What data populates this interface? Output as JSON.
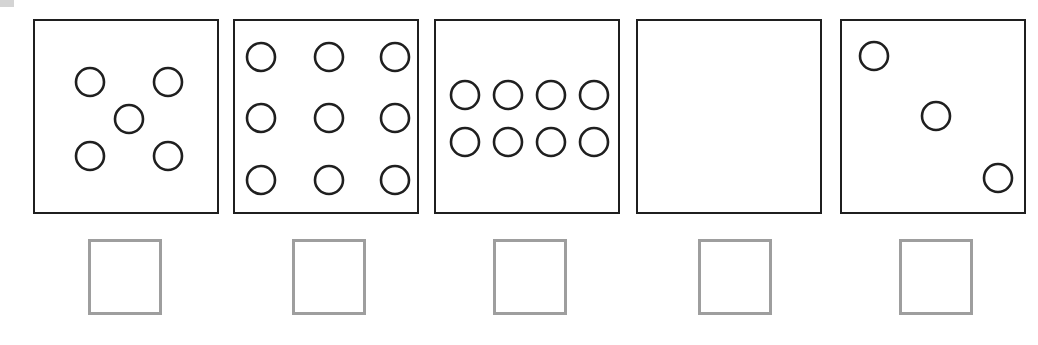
{
  "worksheet": {
    "panel_count": 5,
    "colors": {
      "panel_border": "#1f1f1f",
      "circle_stroke": "#1f1f1f",
      "answer_box_border": "#9e9e9e",
      "background": "#ffffff"
    },
    "panels": [
      {
        "index": 1,
        "circle_count": 5,
        "arrangement": "dice-five",
        "left": 33,
        "circles": [
          {
            "cx": 55,
            "cy": 61
          },
          {
            "cx": 133,
            "cy": 61
          },
          {
            "cx": 94,
            "cy": 98
          },
          {
            "cx": 55,
            "cy": 135
          },
          {
            "cx": 133,
            "cy": 135
          }
        ]
      },
      {
        "index": 2,
        "circle_count": 9,
        "arrangement": "grid-3x3",
        "left": 233,
        "circles": [
          {
            "cx": 26,
            "cy": 36
          },
          {
            "cx": 94,
            "cy": 36
          },
          {
            "cx": 160,
            "cy": 36
          },
          {
            "cx": 26,
            "cy": 97
          },
          {
            "cx": 94,
            "cy": 97
          },
          {
            "cx": 160,
            "cy": 97
          },
          {
            "cx": 26,
            "cy": 159
          },
          {
            "cx": 94,
            "cy": 159
          },
          {
            "cx": 160,
            "cy": 159
          }
        ]
      },
      {
        "index": 3,
        "circle_count": 8,
        "arrangement": "grid-4x2",
        "left": 434,
        "circles": [
          {
            "cx": 29,
            "cy": 74
          },
          {
            "cx": 72,
            "cy": 74
          },
          {
            "cx": 115,
            "cy": 74
          },
          {
            "cx": 158,
            "cy": 74
          },
          {
            "cx": 29,
            "cy": 121
          },
          {
            "cx": 72,
            "cy": 121
          },
          {
            "cx": 115,
            "cy": 121
          },
          {
            "cx": 158,
            "cy": 121
          }
        ]
      },
      {
        "index": 4,
        "circle_count": 0,
        "arrangement": "empty",
        "left": 636,
        "circles": []
      },
      {
        "index": 5,
        "circle_count": 3,
        "arrangement": "diagonal-three",
        "left": 840,
        "circles": [
          {
            "cx": 32,
            "cy": 35
          },
          {
            "cx": 94,
            "cy": 95
          },
          {
            "cx": 156,
            "cy": 157
          }
        ]
      }
    ],
    "circle_radius": 14,
    "answer_boxes": [
      {
        "index": 1,
        "left": 88,
        "value": ""
      },
      {
        "index": 2,
        "left": 292,
        "value": ""
      },
      {
        "index": 3,
        "left": 493,
        "value": ""
      },
      {
        "index": 4,
        "left": 698,
        "value": ""
      },
      {
        "index": 5,
        "left": 899,
        "value": ""
      }
    ]
  }
}
